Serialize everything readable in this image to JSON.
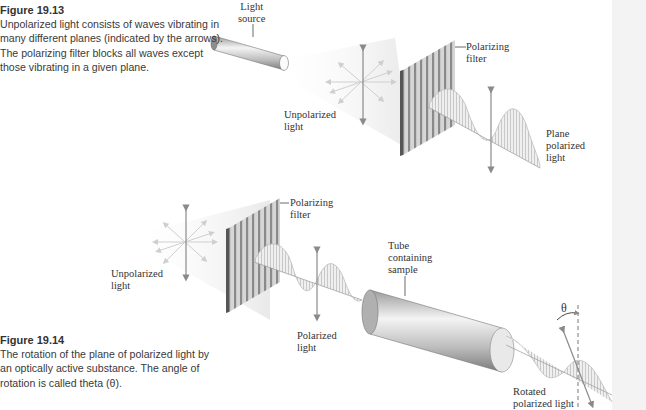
{
  "figure_19_13": {
    "title": "Figure 19.13",
    "caption": "Unpolarized light consists of waves vibrating in many different planes (indicated by the arrows). The polarizing filter blocks all waves except those vibrating in a given plane.",
    "labels": {
      "light_source": "Light\nsource",
      "polarizing_filter": "Polarizing\nfilter",
      "unpolarized_light": "Unpolarized\nlight",
      "plane_polarized_light": "Plane\npolarized\nlight"
    }
  },
  "figure_19_14": {
    "title": "Figure 19.14",
    "caption": "The rotation of the plane of polarized light by an optically active substance. The angle of rotation is called theta (θ).",
    "labels": {
      "polarizing_filter": "Polarizing\nfilter",
      "unpolarized_light": "Unpolarized\nlight",
      "polarized_light": "Polarized\nlight",
      "tube_containing_sample": "Tube\ncontaining\nsample",
      "theta": "θ",
      "rotated_polarized_light": "Rotated\npolarized light"
    }
  },
  "colors": {
    "caption_text": "#3a3a3a",
    "diagram_gray": "#8a8a8a",
    "light_cone": "#f0f0f0",
    "filter_dark": "#777777"
  }
}
